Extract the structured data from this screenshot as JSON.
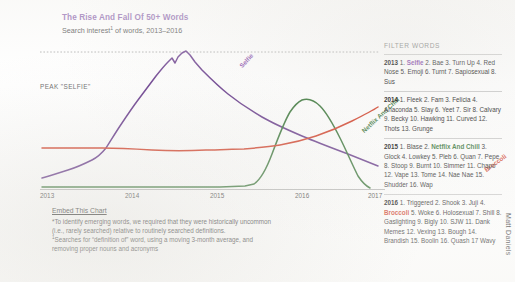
{
  "header": {
    "title": "The Rise And Fall Of 50+ Words",
    "subtitle_pre": "Search interest",
    "subtitle_sup": "1",
    "subtitle_post": " of words, 2013–2016"
  },
  "chart": {
    "peak_label": "PEAK \"SELFIE\"",
    "series_labels": {
      "selfie": "Selfie",
      "netflix": "Netflix And Chill",
      "broccoli": "Broccoli"
    },
    "x_ticks": [
      "2013",
      "2014",
      "2015",
      "2016",
      "2017"
    ]
  },
  "footnotes": {
    "embed_label": "Embed This Chart",
    "note_star": "*To identify emerging words, we required that they were historically uncommon\n(i.e., rarely searched) relative to routinely searched definitions.",
    "note_one_sup": "1",
    "note_one": "Searches for “definition of” word, using a moving 3-month average, and\nremoving proper nouns and acronyms"
  },
  "filter": {
    "heading": "FILTER WORDS",
    "years": [
      {
        "year": "2013",
        "items": "1. Selfie 2. Bae 3. Turn Up 4. Red Nose 5. Emoji 6. Turnt 7. Sapiosexual 8. Sus",
        "highlight": "Selfie",
        "highlight_color": "purple"
      },
      {
        "year": "2014",
        "items": "1. Fleek 2. Fam 3. Felicia 4. Anaconda 5. Slay 6. Yeet 7. Sir 8. Calvary 9. Becky 10. Hawking 11. Curved 12. Thots 13. Grunge",
        "highlight": "",
        "highlight_color": ""
      },
      {
        "year": "2015",
        "items": "1. Blase 2. Netflix And Chill 3. Glock 4. Lowkey 5. Pleb 6. Quan 7. Pepe 8. Stoop 9. Burnt 10. Simmer 11. Chapo 12. Vape 13. Tome 14. Nae Nae 15. Shudder 16. Wap",
        "highlight": "Netflix And Chill",
        "highlight_color": "green"
      },
      {
        "year": "2016",
        "items": "1. Triggered 2. Shook 3. Juji 4. Broccoli 5. Woke 6. Holosexual 7. Shill 8. Gaslighting 9. Bigly 10. SJW 11. Dank Memes 12. Vexing 13. Bough 14. Brandish 15. Boolin 16. Quash 17 Wavy",
        "highlight": "Broccoli",
        "highlight_color": "red"
      }
    ]
  },
  "credit": {
    "author": "Matt Daniels"
  },
  "chart_data": {
    "type": "line",
    "title": "The Rise And Fall Of 50+ Words",
    "subtitle": "Search interest of words, 2013–2016",
    "xlabel": "",
    "ylabel": "Search interest",
    "xlim": [
      2013,
      2017
    ],
    "ylim": [
      0,
      100
    ],
    "grid": false,
    "legend": "inline-labels",
    "annotations": [
      {
        "text": "PEAK \"SELFIE\"",
        "y": 92,
        "type": "horizontal-dotted-reference-line"
      }
    ],
    "series": [
      {
        "name": "Selfie",
        "color": "#6b3f8f",
        "x": [
          2013.0,
          2013.2,
          2013.4,
          2013.6,
          2013.72,
          2013.85,
          2014.0,
          2014.2,
          2014.4,
          2014.55,
          2014.7,
          2014.8,
          2014.88,
          2014.95,
          2015.05,
          2015.2,
          2015.4,
          2015.6,
          2015.8,
          2016.0,
          2016.25,
          2016.5,
          2016.75,
          2017.0
        ],
        "y": [
          8,
          10,
          12,
          16,
          22,
          24,
          26,
          40,
          58,
          72,
          84,
          90,
          86,
          92,
          85,
          76,
          68,
          60,
          54,
          48,
          42,
          36,
          30,
          22
        ]
      },
      {
        "name": "Netflix And Chill",
        "color": "#3f7a3f",
        "x": [
          2013.0,
          2014.0,
          2015.0,
          2015.4,
          2015.55,
          2015.65,
          2015.75,
          2015.85,
          2015.95,
          2016.05,
          2016.2,
          2016.4,
          2016.6,
          2016.8,
          2017.0
        ],
        "y": [
          1,
          1,
          1,
          1,
          2,
          6,
          22,
          52,
          66,
          70,
          66,
          56,
          42,
          26,
          10
        ]
      },
      {
        "name": "Broccoli",
        "color": "#d4452f",
        "x": [
          2013.0,
          2013.3,
          2013.6,
          2013.85,
          2014.0,
          2014.3,
          2014.6,
          2015.0,
          2015.3,
          2015.5,
          2015.8,
          2016.0,
          2016.3,
          2016.55,
          2016.75,
          2016.9,
          2017.0
        ],
        "y": [
          28,
          28,
          28,
          28,
          27,
          27,
          27,
          28,
          29,
          29,
          30,
          31,
          33,
          36,
          40,
          44,
          48
        ]
      }
    ]
  }
}
